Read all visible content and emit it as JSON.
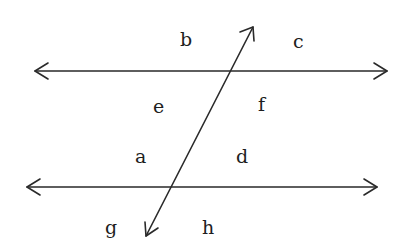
{
  "diagram": {
    "colors": {
      "stroke": "#2a2a2a",
      "text": "#1e1e1e",
      "background": "#ffffff"
    },
    "lines": {
      "top_parallel": {
        "x1": 35,
        "y1": 71,
        "x2": 387,
        "y2": 71,
        "arrows": "both"
      },
      "bottom_parallel": {
        "x1": 27,
        "y1": 187,
        "x2": 377,
        "y2": 187,
        "arrows": "both"
      },
      "transversal": {
        "x1": 253,
        "y1": 27,
        "x2": 146,
        "y2": 236,
        "arrows": "both"
      }
    },
    "labels": [
      {
        "id": "b",
        "text": "b",
        "x": 180,
        "y": 46
      },
      {
        "id": "c",
        "text": "c",
        "x": 293,
        "y": 48
      },
      {
        "id": "e",
        "text": "e",
        "x": 153,
        "y": 113
      },
      {
        "id": "f",
        "text": "f",
        "x": 258,
        "y": 111
      },
      {
        "id": "a",
        "text": "a",
        "x": 135,
        "y": 163
      },
      {
        "id": "d",
        "text": "d",
        "x": 236,
        "y": 163
      },
      {
        "id": "g",
        "text": "g",
        "x": 105,
        "y": 234
      },
      {
        "id": "h",
        "text": "h",
        "x": 202,
        "y": 234
      }
    ]
  }
}
